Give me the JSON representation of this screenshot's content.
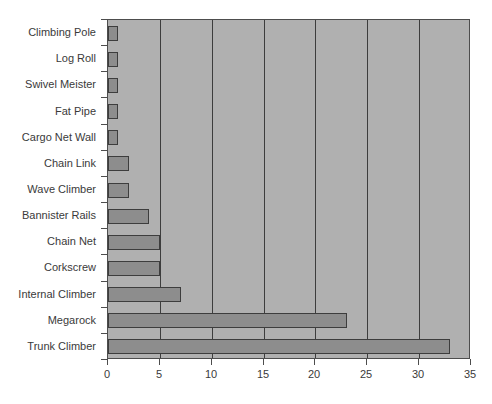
{
  "chart_data": {
    "type": "bar",
    "orientation": "horizontal",
    "title": "",
    "xlabel": "",
    "ylabel": "",
    "xlim": [
      0,
      35
    ],
    "xticks": [
      0,
      5,
      10,
      15,
      20,
      25,
      30,
      35
    ],
    "grid": true,
    "legend": false,
    "categories": [
      "Climbing Pole",
      "Log Roll",
      "Swivel Meister",
      "Fat Pipe",
      "Cargo Net Wall",
      "Chain Link",
      "Wave Climber",
      "Bannister Rails",
      "Chain Net",
      "Corkscrew",
      "Internal Climber",
      "Megarock",
      "Trunk Climber"
    ],
    "values": [
      1,
      1,
      1,
      1,
      1,
      2,
      2,
      4,
      5,
      5,
      7,
      23,
      33
    ],
    "colors": {
      "bar_fill": "#8d8d8d",
      "bar_edge": "#3d3d3d",
      "plot_background": "#b0b0b0",
      "gridline": "#3d3d3d",
      "axis": "#4d4d4d",
      "text": "#3a3a3a",
      "canvas_background": "#ffffff"
    }
  }
}
